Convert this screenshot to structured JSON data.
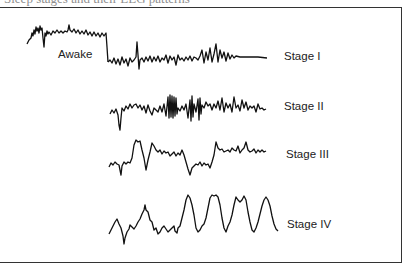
{
  "figure": {
    "caption_cropped": "Sleep stages and their EEG patterns",
    "labels": {
      "awake": "Awake",
      "stage1": "Stage I",
      "stage2": "Stage II",
      "stage3": "Stage III",
      "stage4": "Stage IV"
    },
    "colors": {
      "trace": "#111111",
      "frame": "#333333",
      "background": "#ffffff"
    }
  }
}
